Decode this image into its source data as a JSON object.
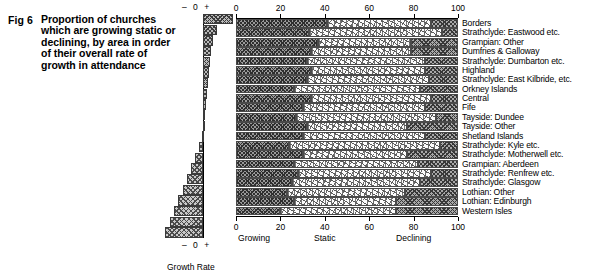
{
  "figure": {
    "number": "Fig 6",
    "caption": "Proportion of churches which are growing static or declining, by area in order of their overall rate of growth in attendance"
  },
  "growth_panel": {
    "top_scale": "– 0 +",
    "bottom_scale": "– 0 +",
    "title": "Growth Rate"
  },
  "stacked_panel": {
    "axis_top_ticks": [
      "0",
      "20",
      "40",
      "60",
      "80",
      "100"
    ],
    "axis_bottom_ticks": [
      "0",
      "20",
      "40",
      "60",
      "80",
      "100"
    ],
    "legend": [
      "Growing",
      "Static",
      "Declining"
    ]
  },
  "chart_data": {
    "type": "bar",
    "title": "Proportion of churches which are growing static or declining, by area in order of their overall rate of growth in attendance",
    "xlabel": "",
    "ylabel": "",
    "xlim": [
      0,
      100
    ],
    "grid": false,
    "orientation": "horizontal",
    "stacked": true,
    "legend_position": "bottom",
    "categories": [
      "Borders",
      "Strathclyde: Eastwood etc.",
      "Grampian: Other",
      "Dumfries & Galloway",
      "Strathclyde: Dumbarton etc.",
      "Highland",
      "Strathclyde: East Kilbride, etc.",
      "Orkney Islands",
      "Central",
      "Fife",
      "Tayside: Dundee",
      "Tayside: Other",
      "Shetland Islands",
      "Strathclyde: Kyle etc.",
      "Strathclyde: Motherwell etc.",
      "Grampian: Aberdeen",
      "Strathclyde: Renfrew etc.",
      "Strathclyde: Glasgow",
      "Lothian: Other",
      "Lothian: Edinburgh",
      "Western Isles"
    ],
    "series": [
      {
        "name": "Growing",
        "values": [
          41,
          33,
          37,
          34,
          32,
          34,
          32,
          26,
          34,
          30,
          27,
          32,
          30,
          24,
          30,
          26,
          28,
          25,
          23,
          26,
          20
        ]
      },
      {
        "name": "Static",
        "values": [
          47,
          60,
          42,
          45,
          53,
          51,
          55,
          57,
          54,
          55,
          63,
          45,
          55,
          68,
          47,
          56,
          60,
          58,
          53,
          46,
          52
        ]
      },
      {
        "name": "Declining",
        "values": [
          12,
          7,
          21,
          21,
          15,
          15,
          13,
          17,
          12,
          15,
          10,
          23,
          15,
          8,
          23,
          18,
          12,
          17,
          24,
          28,
          28
        ]
      }
    ],
    "secondary_chart": {
      "type": "bar",
      "title": "Growth Rate",
      "orientation": "horizontal",
      "diverging": true,
      "axis_labels": [
        "–",
        "0",
        "+"
      ],
      "values": [
        30,
        14,
        10,
        8,
        7,
        6,
        5,
        4,
        3,
        2,
        1,
        -1,
        -3,
        -6,
        -9,
        -12,
        -15,
        -18,
        -21,
        -24,
        -28
      ]
    }
  }
}
